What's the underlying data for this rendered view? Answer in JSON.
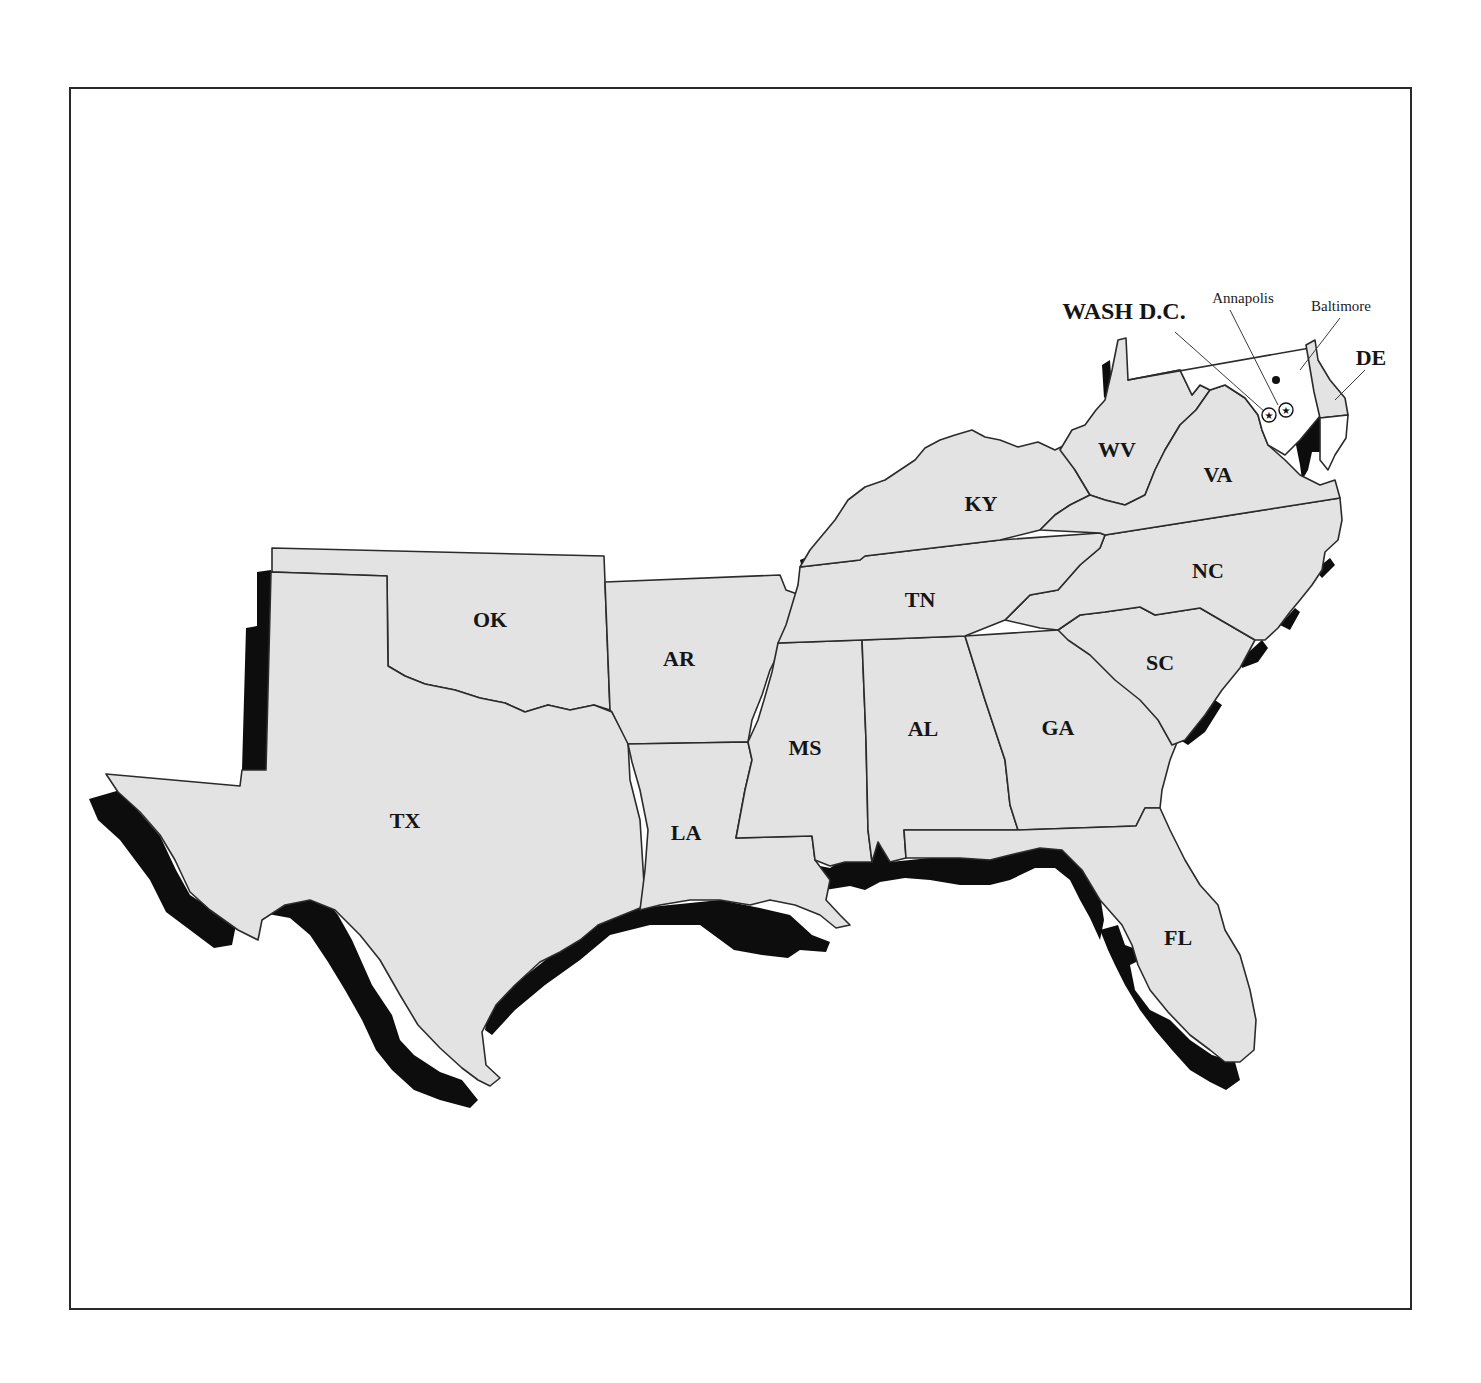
{
  "map": {
    "type": "outline map",
    "region": "Southeastern United States",
    "colors": {
      "land_fill": "#e3e3e3",
      "coastal_zone": "#0d0d0d",
      "border": "#2b2b2b",
      "background": "#ffffff"
    },
    "states": [
      {
        "id": "TX",
        "label": "TX",
        "x": 405,
        "y": 828
      },
      {
        "id": "OK",
        "label": "OK",
        "x": 490,
        "y": 627
      },
      {
        "id": "AR",
        "label": "AR",
        "x": 679,
        "y": 666
      },
      {
        "id": "LA",
        "label": "LA",
        "x": 686,
        "y": 840
      },
      {
        "id": "MS",
        "label": "MS",
        "x": 805,
        "y": 755
      },
      {
        "id": "AL",
        "label": "AL",
        "x": 923,
        "y": 736
      },
      {
        "id": "GA",
        "label": "GA",
        "x": 1058,
        "y": 735
      },
      {
        "id": "FL",
        "label": "FL",
        "x": 1178,
        "y": 945
      },
      {
        "id": "SC",
        "label": "SC",
        "x": 1160,
        "y": 670
      },
      {
        "id": "NC",
        "label": "NC",
        "x": 1208,
        "y": 578
      },
      {
        "id": "TN",
        "label": "TN",
        "x": 920,
        "y": 607
      },
      {
        "id": "KY",
        "label": "KY",
        "x": 981,
        "y": 511
      },
      {
        "id": "WV",
        "label": "WV",
        "x": 1117,
        "y": 457
      },
      {
        "id": "VA",
        "label": "VA",
        "x": 1218,
        "y": 482
      },
      {
        "id": "DE",
        "label": "DE",
        "x": 1371,
        "y": 365
      }
    ],
    "annotations": [
      {
        "id": "wash-dc",
        "label": "WASH D.C.",
        "x": 1124,
        "y": 319,
        "style": "bold"
      },
      {
        "id": "annapolis",
        "label": "Annapolis",
        "x": 1243,
        "y": 303,
        "style": "normal"
      },
      {
        "id": "baltimore",
        "label": "Baltimore",
        "x": 1341,
        "y": 311,
        "style": "normal"
      }
    ]
  }
}
